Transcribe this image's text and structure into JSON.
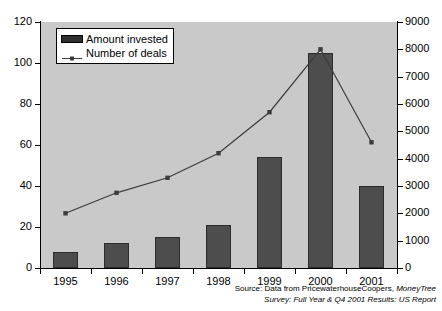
{
  "chart_data": {
    "type": "bar",
    "title": "",
    "xlabel": "",
    "ylabel": "",
    "grid": false,
    "legend_position": "top-left",
    "categories": [
      "1995",
      "1996",
      "1997",
      "1998",
      "1999",
      "2000",
      "2001"
    ],
    "series": [
      {
        "name": "Amount invested",
        "type": "bar",
        "axis": "left",
        "values": [
          8,
          12,
          15,
          21,
          54,
          105,
          40
        ],
        "color": "#4d4d4d"
      },
      {
        "name": "Number of deals",
        "type": "line",
        "axis": "right",
        "values": [
          2000,
          2750,
          3300,
          4200,
          5700,
          8000,
          4600
        ],
        "color": "#3c3c3c"
      }
    ],
    "left_axis": {
      "ylim": [
        0,
        120
      ],
      "ticks": [
        0,
        20,
        40,
        60,
        80,
        100,
        120
      ]
    },
    "right_axis": {
      "ylim": [
        0,
        9000
      ],
      "ticks": [
        0,
        1000,
        2000,
        3000,
        4000,
        5000,
        6000,
        7000,
        8000,
        9000
      ]
    },
    "plot_background": "#c9c9c9"
  },
  "legend": {
    "items": [
      {
        "label": "Amount invested",
        "key": "bar-swatch"
      },
      {
        "label": "Number of deals",
        "key": "line-marker"
      }
    ]
  },
  "caption": {
    "line1_plain": "Source: Data from PricewaterhouseCoopers, ",
    "line1_italic": "MoneyTree",
    "line2_italic": "Survey: Full Year & Q4 2001 Results: US Report"
  }
}
